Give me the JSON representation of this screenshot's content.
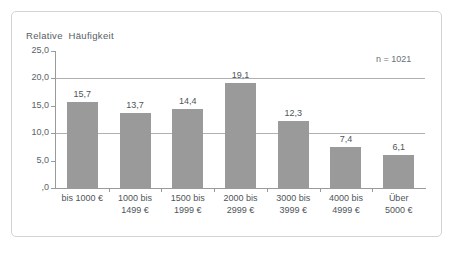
{
  "annotation": {
    "sample_size": "n = 1021"
  },
  "chart_data": {
    "type": "bar",
    "title": "",
    "ylabel": "Relative  Häufigkeit",
    "xlabel": "",
    "ylim": [
      0,
      25
    ],
    "yticks": [
      "25,0",
      "20,0",
      "15,0",
      "10,0",
      "5,0",
      ",0"
    ],
    "ytick_values": [
      25,
      20,
      15,
      10,
      5,
      0
    ],
    "gridlines_at": [
      20,
      10
    ],
    "grid": true,
    "legend": "none",
    "bar_color": "#9a9a9a",
    "categories": [
      "bis 1000 €",
      "1000 bis\n1499 €",
      "1500 bis\n1999 €",
      "2000 bis\n2999 €",
      "3000 bis\n3999 €",
      "4000 bis\n4999 €",
      "Über\n5000 €"
    ],
    "category_lines": [
      [
        "bis 1000 €"
      ],
      [
        "1000 bis",
        "1499 €"
      ],
      [
        "1500 bis",
        "1999 €"
      ],
      [
        "2000 bis",
        "2999 €"
      ],
      [
        "3000 bis",
        "3999 €"
      ],
      [
        "4000 bis",
        "4999 €"
      ],
      [
        "Über",
        "5000 €"
      ]
    ],
    "values": [
      15.7,
      13.7,
      14.4,
      19.1,
      12.3,
      7.4,
      6.1
    ],
    "value_labels": [
      "15,7",
      "13,7",
      "14,4",
      "19,1",
      "12,3",
      "7,4",
      "6,1"
    ]
  }
}
